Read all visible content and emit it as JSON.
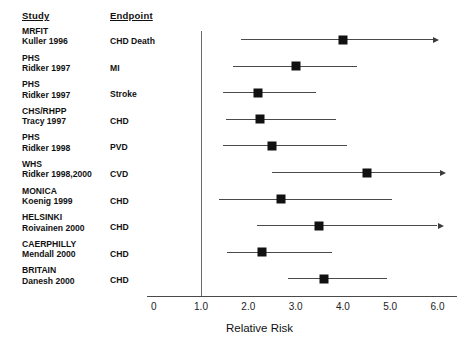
{
  "headers": {
    "study": "Study",
    "endpoint": "Endpoint"
  },
  "axis": {
    "title": "Relative Risk",
    "ticks": [
      "0",
      "1.0",
      "2.0",
      "3.0",
      "4.0",
      "5.0",
      "6.0"
    ],
    "tick_values": [
      0,
      1,
      2,
      3,
      4,
      5,
      6
    ],
    "null_value": 1.0
  },
  "rows": [
    {
      "study_line1": "MRFIT",
      "study_line2": "Kuller 1996",
      "endpoint": "CHD Death",
      "estimate": 4.0,
      "ci_low": 1.85,
      "ci_high": 5.9,
      "truncated_high": true
    },
    {
      "study_line1": "PHS",
      "study_line2": "Ridker 1997",
      "endpoint": "MI",
      "estimate": 3.0,
      "ci_low": 1.67,
      "ci_high": 4.3,
      "truncated_high": false
    },
    {
      "study_line1": "PHS",
      "study_line2": "Ridker 1997",
      "endpoint": "Stroke",
      "estimate": 2.2,
      "ci_low": 1.46,
      "ci_high": 3.44,
      "truncated_high": false
    },
    {
      "study_line1": "CHS/RHPP",
      "study_line2": "Tracy 1997",
      "endpoint": "CHD",
      "estimate": 2.25,
      "ci_low": 1.52,
      "ci_high": 3.85,
      "truncated_high": false
    },
    {
      "study_line1": "PHS",
      "study_line2": "Ridker 1998",
      "endpoint": "PVD",
      "estimate": 2.5,
      "ci_low": 1.46,
      "ci_high": 4.08,
      "truncated_high": false
    },
    {
      "study_line1": "WHS",
      "study_line2": "Ridker 1998,2000",
      "endpoint": "CVD",
      "estimate": 4.5,
      "ci_low": 2.5,
      "ci_high": 6.05,
      "truncated_high": true
    },
    {
      "study_line1": "MONICA",
      "study_line2": "Koenig 1999",
      "endpoint": "CHD",
      "estimate": 2.7,
      "ci_low": 1.38,
      "ci_high": 5.04,
      "truncated_high": false
    },
    {
      "study_line1": "HELSINKI",
      "study_line2": "Roivainen 2000",
      "endpoint": "CHD",
      "estimate": 3.5,
      "ci_low": 2.19,
      "ci_high": 6.0,
      "truncated_high": true
    },
    {
      "study_line1": "CAERPHILLY",
      "study_line2": "Mendall 2000",
      "endpoint": "CHD",
      "estimate": 2.3,
      "ci_low": 1.54,
      "ci_high": 3.77,
      "truncated_high": false
    },
    {
      "study_line1": "BRITAIN",
      "study_line2": "Danesh 2000",
      "endpoint": "CHD",
      "estimate": 3.6,
      "ci_low": 2.83,
      "ci_high": 4.94,
      "truncated_high": false
    }
  ],
  "chart_data": {
    "type": "scatter",
    "title": "",
    "xlabel": "Relative Risk",
    "ylabel": "",
    "xlim": [
      0,
      6.3
    ],
    "grid": false,
    "legend": "none",
    "null_reference_line": 1.0,
    "categories": [
      "MRFIT Kuller 1996 - CHD Death",
      "PHS Ridker 1997 - MI",
      "PHS Ridker 1997 - Stroke",
      "CHS/RHPP Tracy 1997 - CHD",
      "PHS Ridker 1998 - PVD",
      "WHS Ridker 1998,2000 - CVD",
      "MONICA Koenig 1999 - CHD",
      "HELSINKI Roivainen 2000 - CHD",
      "CAERPHILLY Mendall 2000 - CHD",
      "BRITAIN Danesh 2000 - CHD"
    ],
    "values": [
      4.0,
      3.0,
      2.2,
      2.25,
      2.5,
      4.5,
      2.7,
      3.5,
      2.3,
      3.6
    ],
    "ci_low": [
      1.85,
      1.67,
      1.46,
      1.52,
      1.46,
      2.5,
      1.38,
      2.19,
      1.54,
      2.83
    ],
    "ci_high": [
      5.9,
      4.3,
      3.44,
      3.85,
      4.08,
      6.05,
      5.04,
      6.0,
      3.77,
      4.94
    ],
    "arrow_truncated": [
      true,
      false,
      false,
      false,
      false,
      true,
      false,
      true,
      false,
      false
    ]
  }
}
